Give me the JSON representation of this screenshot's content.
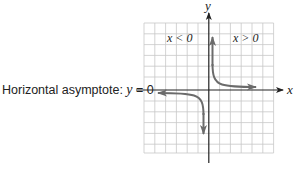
{
  "diagram": {
    "annotation": {
      "prefix": "Horizontal asymptote: ",
      "variable": "y",
      "suffix": " = 0"
    },
    "axes": {
      "x_label": "x",
      "y_label": "y"
    },
    "regions": {
      "left_label": "x < 0",
      "right_label": "x > 0"
    },
    "grid": {
      "columns": 12,
      "rows": 12,
      "line_color": "#c8c8c8"
    },
    "colors": {
      "axis": "#222222",
      "curve": "#6b6b6b",
      "text": "#222222"
    },
    "curve": {
      "function": "reciprocal-type, two branches",
      "branches": [
        "Quadrant I branch",
        "Quadrant III branch"
      ]
    }
  }
}
